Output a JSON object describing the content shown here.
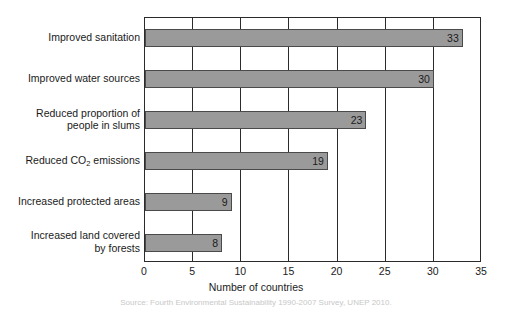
{
  "chart_data": {
    "type": "bar",
    "orientation": "horizontal",
    "title": "",
    "xlabel": "Number of countries",
    "ylabel": "",
    "xlim": [
      0,
      35
    ],
    "xticks": [
      0,
      5,
      10,
      15,
      20,
      25,
      30,
      35
    ],
    "grid": true,
    "legend": null,
    "categories": [
      "Improved sanitation",
      "Improved water sources",
      "Reduced proportion of\npeople in slums",
      "Reduced CO2 emissions",
      "Increased protected areas",
      "Increased land covered\nby forests"
    ],
    "values": [
      33,
      30,
      23,
      19,
      9,
      8
    ],
    "data_labels": [
      "33",
      "30",
      "23",
      "19",
      "9",
      "8"
    ],
    "bar_color": "#9a9a9a",
    "bar_border_color": "#4a4a4a",
    "axis_color": "#2b2b2b"
  },
  "categories_rich": [
    {
      "lines": [
        "Improved sanitation"
      ],
      "value": 33,
      "label": "33"
    },
    {
      "lines": [
        "Improved water sources"
      ],
      "value": 30,
      "label": "30"
    },
    {
      "lines": [
        "Reduced proportion of",
        "people in slums"
      ],
      "value": 23,
      "label": "23"
    },
    {
      "lines": [
        "Reduced CO",
        "SUB2",
        " emissions"
      ],
      "value": 19,
      "label": "19",
      "has_subscript": true,
      "plain": "Reduced CO2 emissions"
    },
    {
      "lines": [
        "Increased protected areas"
      ],
      "value": 9,
      "label": "9"
    },
    {
      "lines": [
        "Increased land covered",
        "by forests"
      ],
      "value": 8,
      "label": "8"
    }
  ],
  "axis": {
    "ticks": [
      "0",
      "5",
      "10",
      "15",
      "20",
      "25",
      "30",
      "35"
    ],
    "title": "Number of countries"
  },
  "caption": {
    "text": "Source: Fourth Environmental Sustainability 1990-2007 Survey, UNEP 2010.",
    "visibility": "faint-cropped"
  }
}
